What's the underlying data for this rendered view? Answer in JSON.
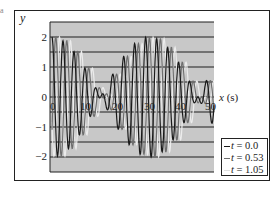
{
  "chart_data": {
    "type": "line",
    "title": "",
    "xlabel": "x (s)",
    "ylabel": "y",
    "xlim": [
      0,
      50
    ],
    "ylim": [
      -2.5,
      2.5
    ],
    "x_ticks": [
      "0",
      "10",
      "20",
      "30",
      "40",
      "50"
    ],
    "y_ticks": [
      "2",
      "1",
      "0",
      "-1",
      "-2"
    ],
    "grid": {
      "horizontal": true,
      "vertical": false,
      "spacing": 0.5
    },
    "background": "#c8c8c8",
    "legend_position": "lower right, outside plot",
    "series": [
      {
        "name": "t = 0.0",
        "color": "#1a1a1a",
        "phase_shift": 0.0,
        "x": [
          0,
          2.5,
          5,
          7.5,
          10,
          12.5,
          15,
          17.5,
          20,
          22.5,
          25,
          27.5,
          30,
          32.5,
          35,
          37.5,
          40,
          42.5,
          45,
          47.5,
          50
        ],
        "y": [
          2.0,
          -1.2,
          -1.9,
          1.3,
          -1.0,
          0.5,
          0.3,
          0.4,
          0.5,
          -0.9,
          1.4,
          -1.8,
          2.0,
          -1.5,
          1.0,
          -0.9,
          0.9,
          -0.3,
          0.3,
          0.1,
          0.4
        ]
      },
      {
        "name": "t = 0.53",
        "color": "#6e6e6e",
        "phase_shift": 0.53,
        "x": [
          0,
          2.5,
          5,
          7.5,
          10,
          12.5,
          15,
          17.5,
          20,
          22.5,
          25,
          27.5,
          30,
          32.5,
          35,
          37.5,
          40,
          42.5,
          45,
          47.5,
          50
        ],
        "y": [
          1.2,
          1.9,
          -1.6,
          -1.5,
          1.0,
          -0.6,
          0.1,
          0.5,
          -0.1,
          -0.4,
          1.2,
          0.8,
          -1.8,
          1.8,
          -1.1,
          0.9,
          -0.4,
          0.5,
          -0.1,
          0.4,
          0.2
        ]
      },
      {
        "name": "t = 1.05",
        "color": "#ececec",
        "phase_shift": 1.05,
        "x": [
          0,
          2.5,
          5,
          7.5,
          10,
          12.5,
          15,
          17.5,
          20,
          22.5,
          25,
          27.5,
          30,
          32.5,
          35,
          37.5,
          40,
          42.5,
          45,
          47.5,
          50
        ],
        "y": [
          -0.5,
          1.4,
          1.9,
          -1.7,
          -1.4,
          1.0,
          -0.3,
          0.3,
          0.3,
          0.5,
          -1.2,
          1.6,
          1.2,
          -1.9,
          1.3,
          -1.0,
          0.8,
          -0.8,
          0.2,
          -0.2,
          0.1
        ]
      }
    ]
  },
  "axes": {
    "y_label": "y",
    "x_label_var": "x",
    "x_label_unit": "(s)",
    "y_ticks": [
      "2",
      "1",
      "0",
      "−1",
      "−2"
    ],
    "x_ticks": [
      "0",
      "10",
      "20",
      "30",
      "40",
      "50"
    ]
  },
  "legend": {
    "items": [
      {
        "prefix": "t",
        "value": "= 0.0",
        "color": "#1a1a1a"
      },
      {
        "prefix": "t",
        "value": "= 0.53",
        "color": "#6e6e6e"
      },
      {
        "prefix": "t",
        "value": "= 1.05",
        "color": "#e0e0e0"
      }
    ]
  },
  "figure": {
    "corner_mark": "a"
  }
}
